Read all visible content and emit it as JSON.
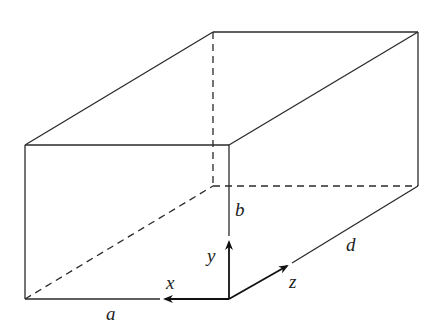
{
  "figure": {
    "dimension_labels": {
      "width": "a",
      "height": "b",
      "depth": "d"
    },
    "axis_labels": {
      "x": "x",
      "y": "y",
      "z": "z"
    },
    "colors": {
      "line": "#2a2a2a",
      "background": "#ffffff"
    }
  }
}
